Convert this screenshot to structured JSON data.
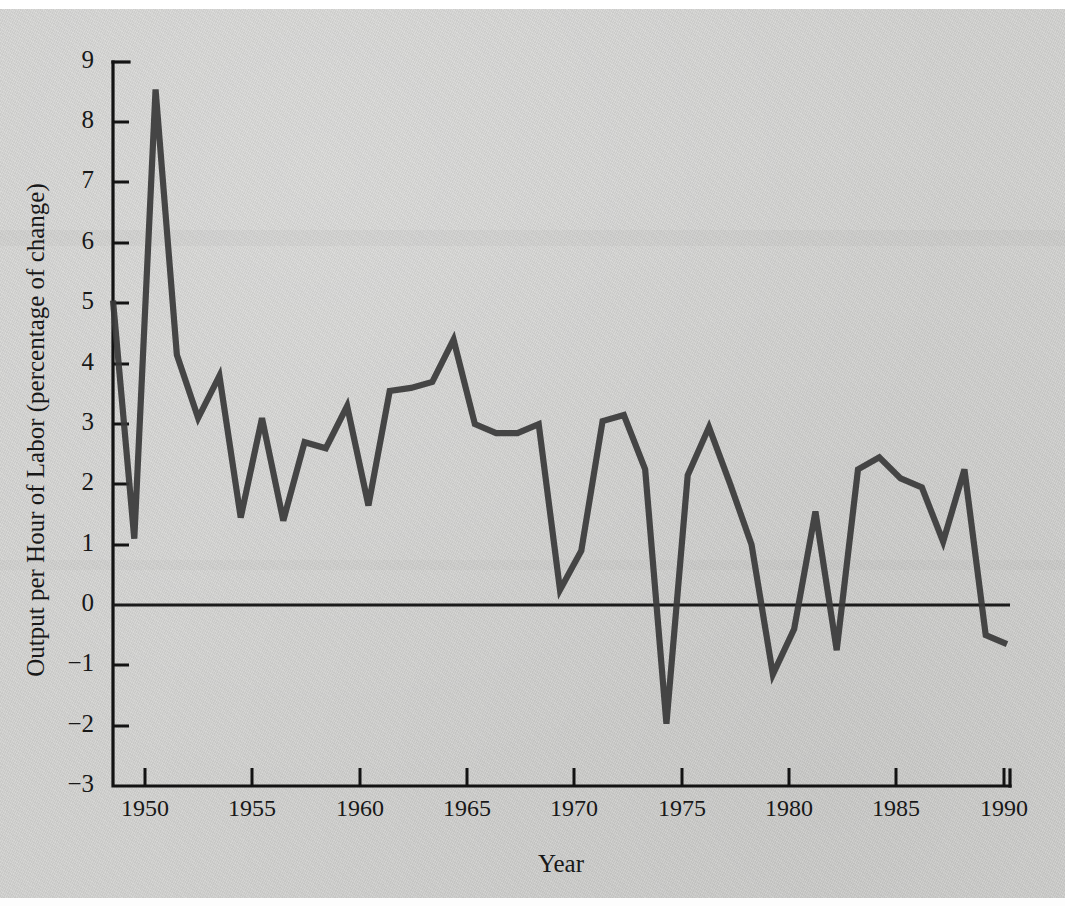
{
  "figure": {
    "background_color": "#d3d3d1",
    "line_color": "#3a3a3a",
    "axis_color": "#131313"
  },
  "axes": {
    "x_title": "Year",
    "y_title": "Output per Hour of Labor (percentage of change)",
    "x_tick_labels": [
      "1950",
      "1955",
      "1960",
      "1965",
      "1970",
      "1975",
      "1980",
      "1985",
      "1990"
    ],
    "y_tick_labels": [
      "9",
      "8",
      "7",
      "6",
      "5",
      "4",
      "3",
      "2",
      "1",
      "0",
      "−1",
      "−2",
      "−3"
    ]
  },
  "chart_data": {
    "type": "line",
    "title": "",
    "subtitle": "",
    "xlabel": "Year",
    "ylabel": "Output per Hour of Labor (percentage of change)",
    "xlim": [
      1948,
      1990
    ],
    "ylim": [
      -3,
      9
    ],
    "xticks": [
      1950,
      1955,
      1960,
      1965,
      1970,
      1975,
      1980,
      1985,
      1990
    ],
    "yticks": [
      -3,
      -2,
      -1,
      0,
      1,
      2,
      3,
      4,
      5,
      6,
      7,
      8,
      9
    ],
    "grid": false,
    "legend": null,
    "zero_reference_line": 0,
    "series": [
      {
        "name": "Output per Hour of Labor",
        "x": [
          1948,
          1949,
          1950,
          1951,
          1952,
          1953,
          1954,
          1955,
          1956,
          1957,
          1958,
          1959,
          1960,
          1961,
          1962,
          1963,
          1964,
          1965,
          1966,
          1967,
          1968,
          1969,
          1970,
          1971,
          1972,
          1973,
          1974,
          1975,
          1976,
          1977,
          1978,
          1979,
          1980,
          1981,
          1982,
          1983,
          1984,
          1985,
          1986,
          1987,
          1988,
          1989,
          1990
        ],
        "values": [
          5.05,
          1.1,
          8.55,
          4.15,
          3.1,
          3.8,
          1.45,
          3.1,
          1.4,
          2.7,
          2.6,
          3.3,
          1.65,
          3.55,
          3.6,
          3.7,
          4.4,
          3.0,
          2.85,
          2.85,
          3.0,
          0.25,
          0.9,
          3.05,
          3.15,
          2.25,
          -1.97,
          2.15,
          2.95,
          2.0,
          1.0,
          -1.15,
          -0.4,
          1.55,
          -0.75,
          2.25,
          2.45,
          2.1,
          1.95,
          1.05,
          2.25,
          -0.5,
          -0.65
        ]
      }
    ]
  }
}
